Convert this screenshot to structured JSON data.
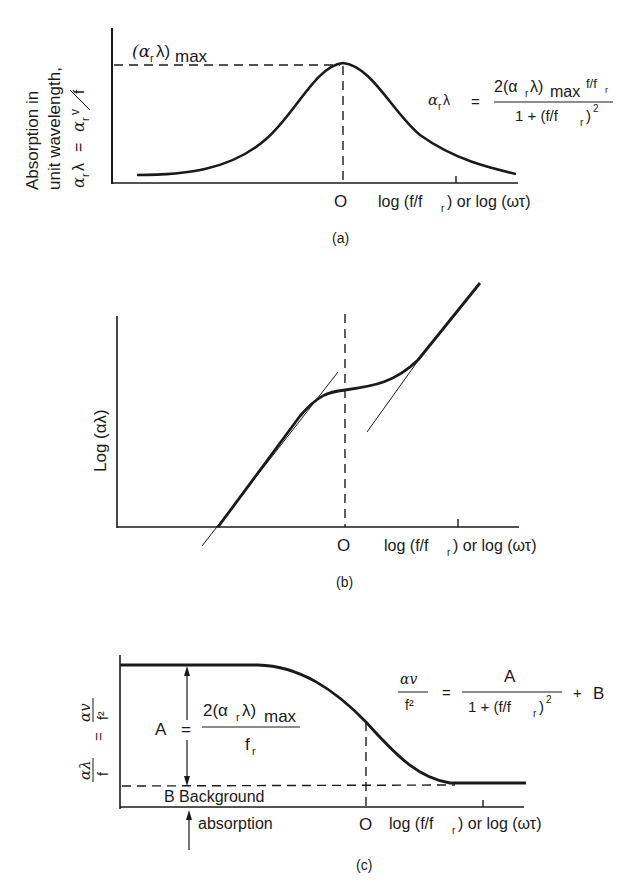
{
  "panels": [
    {
      "id": "a",
      "caption": "(a)",
      "y_label_line1": "Absorption in",
      "y_label_line2": "unit wavelength,",
      "y_label_formula_lhs": "α",
      "y_label_formula_lhs_sub": "r",
      "y_label_formula_lambda": "λ",
      "y_label_formula_eq": "=",
      "y_label_formula_rhs": "α",
      "y_label_formula_rhs_sub": "r",
      "y_label_formula_v": "v",
      "y_label_formula_f": "f",
      "peak_label": "(α",
      "peak_label_sub": "r",
      "peak_label_close": "λ)",
      "peak_label_max": "max",
      "origin_label": "O",
      "x_label": "log (f/f",
      "x_label_sub": "r",
      "x_label_tail": ") or log (ωτ)",
      "equation": {
        "lhs": "α",
        "lhs_sub": "r",
        "lhs_tail": "λ",
        "eq": "=",
        "numerator": "2(α",
        "numerator_sub": "r",
        "numerator_tail": "λ)",
        "numerator_max": "max",
        "numerator_ratio": "f/f",
        "numerator_ratio_sub": "r",
        "denominator": "1 + (f/f",
        "denominator_sub": "r",
        "denominator_tail": ")",
        "denominator_exp": "2"
      }
    },
    {
      "id": "b",
      "caption": "(b)",
      "y_label": "Log (αλ)",
      "origin_label": "O",
      "x_label": "log (f/f",
      "x_label_sub": "r",
      "x_label_tail": ") or log (ωτ)"
    },
    {
      "id": "c",
      "caption": "(c)",
      "y_label_top": "αλ",
      "y_label_bottom": "f",
      "y_label_eq": "=",
      "y_label_top2": "αv",
      "y_label_bottom2": "f²",
      "A_label": "A",
      "A_eq": "=",
      "A_numerator": "2(α",
      "A_numerator_sub": "r",
      "A_numerator_tail": "λ)",
      "A_numerator_max": "max",
      "A_denominator": "f",
      "A_denominator_sub": "r",
      "B_label": "B  Background",
      "absorption_label": "absorption",
      "origin_label": "O",
      "x_label": "log (f/f",
      "x_label_sub": "r",
      "x_label_tail": ") or log (ωτ)",
      "equation": {
        "lhs_num": "αv",
        "lhs_den": "f²",
        "eq": "=",
        "numerator": "A",
        "denominator": "1 + (f/f",
        "denominator_sub": "r",
        "denominator_tail": ")",
        "denominator_exp": "2",
        "plus": "+",
        "tail": "B"
      }
    }
  ]
}
